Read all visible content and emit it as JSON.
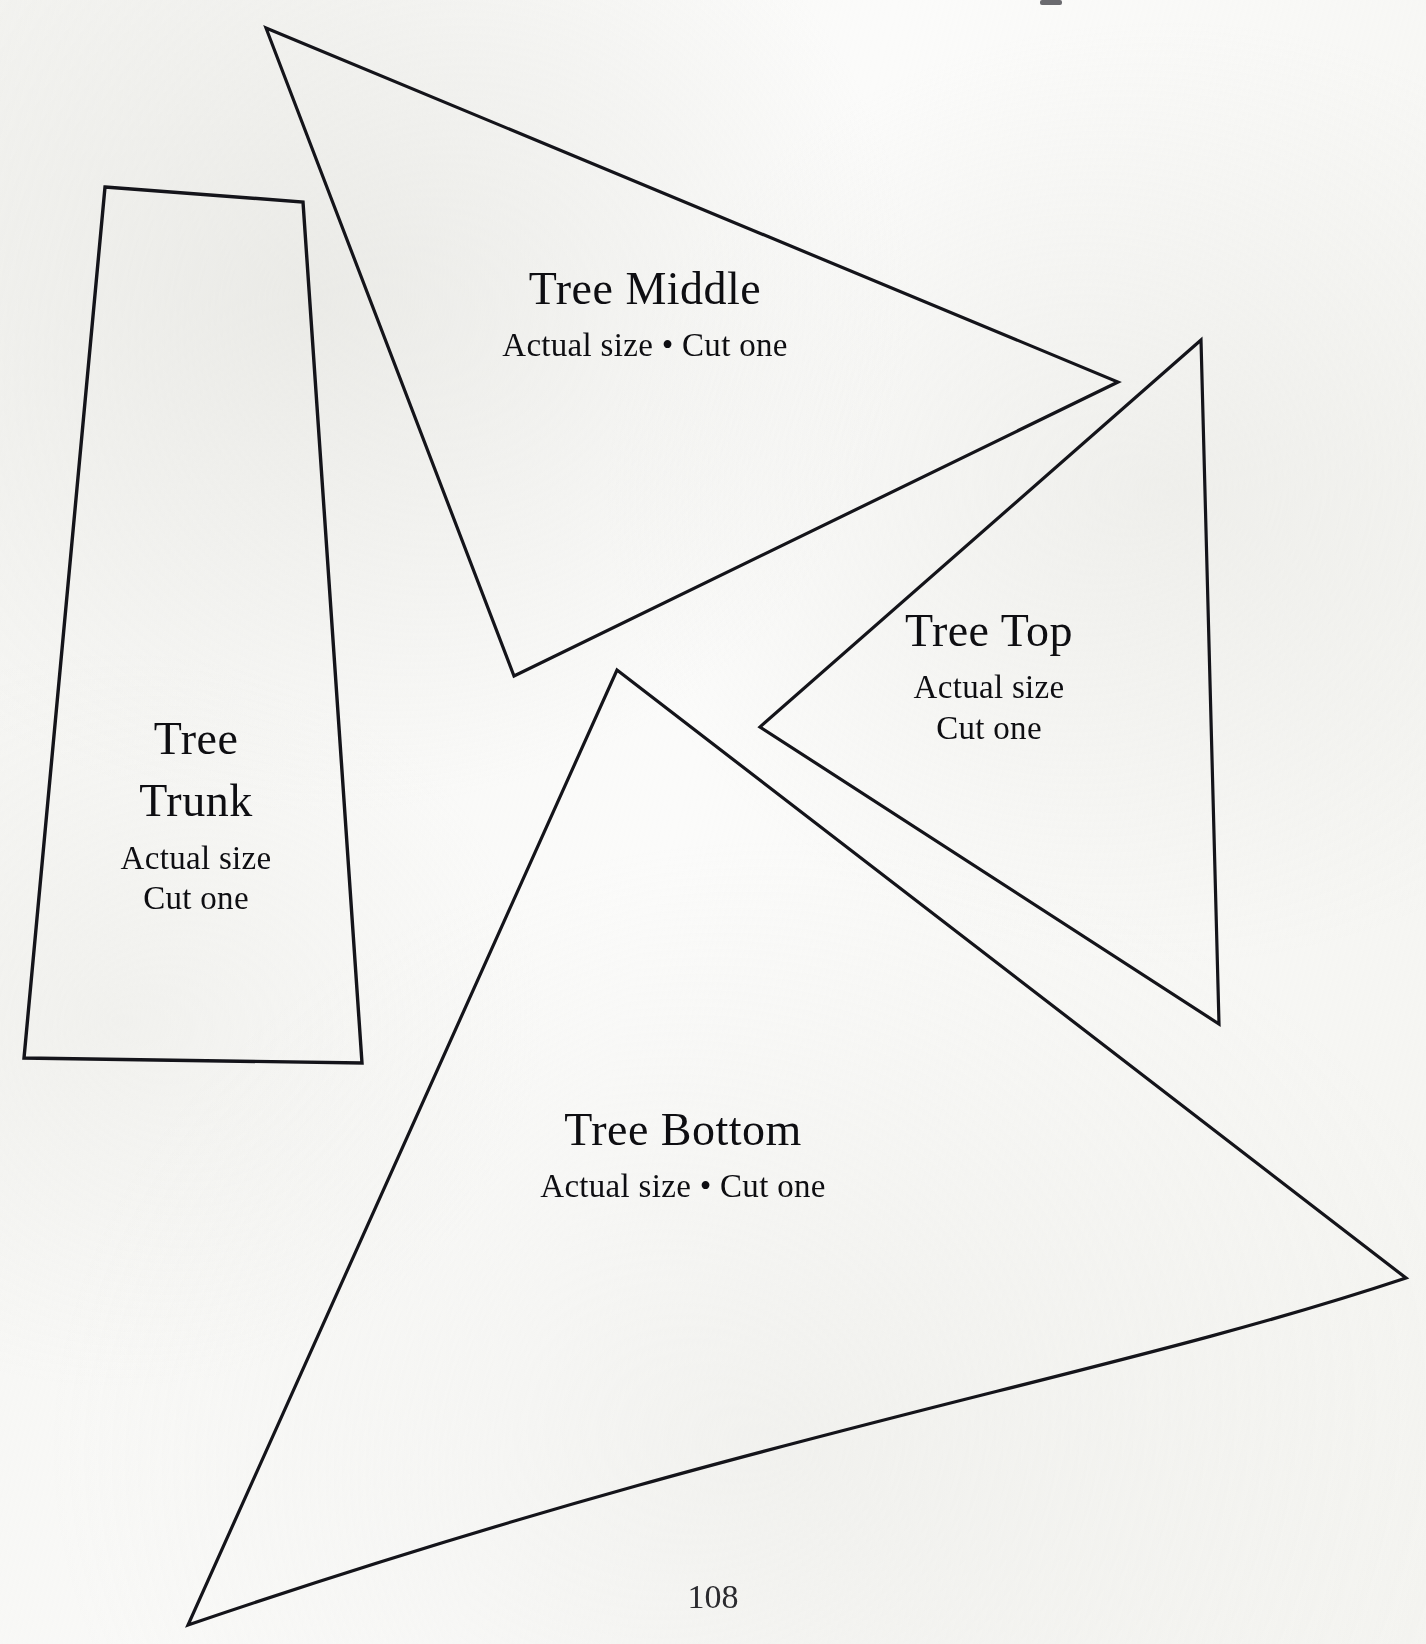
{
  "page": {
    "number": "108",
    "background_color": "#fbfbfa",
    "ink_color": "#14141a"
  },
  "pieces": [
    {
      "id": "tree-middle",
      "title": "Tree Middle",
      "subtitle_lines": [
        "Actual size • Cut one"
      ],
      "shape": "triangle",
      "vertices": [
        [
          266,
          28
        ],
        [
          1118,
          382
        ],
        [
          514,
          676
        ]
      ],
      "label_position": [
        645,
        305
      ]
    },
    {
      "id": "tree-top",
      "title": "Tree Top",
      "subtitle_lines": [
        "Actual size",
        "Cut one"
      ],
      "shape": "triangle",
      "vertices": [
        [
          1201,
          340
        ],
        [
          1219,
          1024
        ],
        [
          760,
          727
        ]
      ],
      "label_position": [
        989,
        655
      ]
    },
    {
      "id": "tree-trunk",
      "title_lines": [
        "Tree",
        "Trunk"
      ],
      "title": "Tree Trunk",
      "subtitle_lines": [
        "Actual size",
        "Cut one"
      ],
      "shape": "quadrilateral",
      "vertices": [
        [
          105,
          187
        ],
        [
          303,
          202
        ],
        [
          362,
          1063
        ],
        [
          24,
          1058
        ]
      ],
      "label_position": [
        196,
        760
      ]
    },
    {
      "id": "tree-bottom",
      "title": "Tree Bottom",
      "subtitle_lines": [
        "Actual size • Cut one"
      ],
      "shape": "curved-triangle",
      "vertices": [
        [
          617,
          670
        ],
        [
          1406,
          1278
        ],
        [
          188,
          1625
        ]
      ],
      "label_position": [
        683,
        1145
      ]
    }
  ],
  "marks": {
    "corner_mark": "scan-artifact-mark"
  }
}
